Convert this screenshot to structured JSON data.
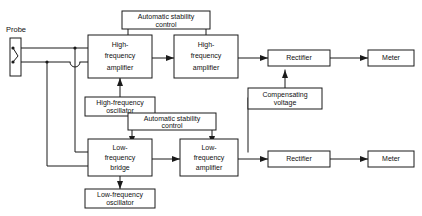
{
  "diagram": {
    "stroke_color": "#1a1a1a",
    "background_color": "#ffffff",
    "labels": {
      "probe": "Probe"
    },
    "blocks": [
      {
        "id": "asc-top",
        "lines": [
          "Automatic stability",
          "control"
        ],
        "line1": "Automatic stability",
        "line2": "control"
      },
      {
        "id": "hf-amp-1",
        "lines": [
          "High-",
          "frequency",
          "amplifier"
        ],
        "line1": "High-",
        "line2": "frequency",
        "line3": "amplifier"
      },
      {
        "id": "hf-amp-2",
        "lines": [
          "High-",
          "frequency",
          "amplifier"
        ],
        "line1": "High-",
        "line2": "frequency",
        "line3": "amplifier"
      },
      {
        "id": "rectifier-top",
        "line1": "Rectifier"
      },
      {
        "id": "meter-top",
        "line1": "Meter"
      },
      {
        "id": "hf-osc",
        "lines": [
          "High-frequency",
          "oscillator"
        ],
        "line1": "High-frequency",
        "line2": "oscillator"
      },
      {
        "id": "comp-voltage",
        "lines": [
          "Compensating",
          "voltage"
        ],
        "line1": "Compensating",
        "line2": "voltage"
      },
      {
        "id": "asc-bottom",
        "lines": [
          "Automatic stability",
          "control"
        ],
        "line1": "Automatic stability",
        "line2": "control"
      },
      {
        "id": "lf-bridge",
        "lines": [
          "Low-",
          "frequency",
          "bridge"
        ],
        "line1": "Low-",
        "line2": "frequency",
        "line3": "bridge"
      },
      {
        "id": "lf-amp",
        "lines": [
          "Low-",
          "frequency",
          "amplifier"
        ],
        "line1": "Low-",
        "line2": "frequency",
        "line3": "amplifier"
      },
      {
        "id": "lf-osc",
        "lines": [
          "Low-frequency",
          "oscillator"
        ],
        "line1": "Low-frequency",
        "line2": "oscillator"
      },
      {
        "id": "rectifier-bottom",
        "line1": "Rectifier"
      },
      {
        "id": "meter-bottom",
        "line1": "Meter"
      }
    ]
  }
}
